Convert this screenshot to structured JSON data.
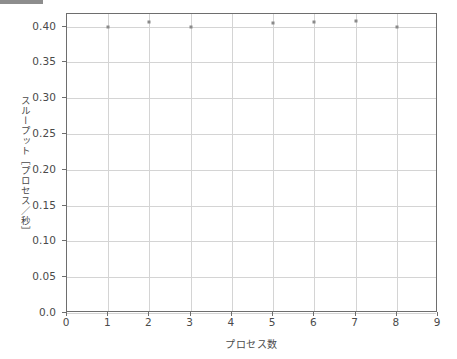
{
  "figure": {
    "top_bar_name": "top-left-gray-bar"
  },
  "chart_data": {
    "type": "scatter",
    "title": "",
    "xlabel": "プロセス数",
    "ylabel": "スループット［プロセス／秒］",
    "xlim": [
      0,
      9
    ],
    "ylim": [
      0.0,
      0.4175
    ],
    "grid": true,
    "legend": null,
    "marker_color": "#8a8a8a",
    "xticks": [
      0,
      1,
      2,
      3,
      4,
      5,
      6,
      7,
      8,
      9
    ],
    "xticklabels": [
      "0",
      "1",
      "2",
      "3",
      "4",
      "5",
      "6",
      "7",
      "8",
      "9"
    ],
    "yticks": [
      0.0,
      0.05,
      0.1,
      0.15,
      0.2,
      0.25,
      0.3,
      0.35,
      0.4
    ],
    "yticklabels": [
      "0.0",
      "0.05",
      "0.10",
      "0.15",
      "0.20",
      "0.25",
      "0.30",
      "0.35",
      "0.40"
    ],
    "x": [
      1,
      2,
      3,
      5,
      6,
      7,
      8
    ],
    "y": [
      0.399,
      0.407,
      0.4,
      0.405,
      0.407,
      0.408,
      0.4
    ],
    "points": [
      {
        "x": 1,
        "y": 0.399
      },
      {
        "x": 2,
        "y": 0.407
      },
      {
        "x": 3,
        "y": 0.4
      },
      {
        "x": 5,
        "y": 0.405
      },
      {
        "x": 6,
        "y": 0.407
      },
      {
        "x": 7,
        "y": 0.408
      },
      {
        "x": 8,
        "y": 0.4
      }
    ]
  }
}
